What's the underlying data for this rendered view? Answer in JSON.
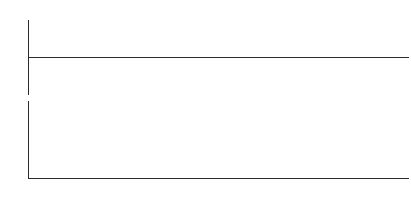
{
  "chart_data": [
    {
      "type": "bar",
      "panel": "top",
      "title": "",
      "xlabel": "",
      "ylabel": "",
      "ylim": [
        -50,
        50
      ],
      "yticks": [
        50,
        0,
        -50
      ],
      "ytick_labels": [
        "50%",
        "0%",
        "-50%"
      ],
      "grid": true,
      "legend": "none",
      "zero_line": true,
      "units": "percent",
      "categories": [
        "P1",
        "P2",
        "P3",
        "P4",
        "P5",
        "P6",
        "P7",
        "P8",
        "P9",
        "P10",
        "P11",
        "P12",
        "P13",
        "P14",
        "P15",
        "P16",
        "P17",
        "P18",
        "P19",
        "P20",
        "P21",
        "P22",
        "P23",
        "P24",
        "P25",
        "P26",
        "P27",
        "P28",
        "P29",
        "P30",
        "P31",
        "P32",
        "P33",
        "P34",
        "P35",
        "P36",
        "P37",
        "P38",
        "P39",
        "P40",
        "P41",
        "P42",
        "P43",
        "P44",
        "P45",
        "P46",
        "P47",
        "P48",
        "P49",
        "P50",
        "P51",
        "P52",
        "P53"
      ],
      "values": [
        30,
        31,
        28,
        26,
        29,
        28,
        27,
        20,
        26,
        24,
        23,
        29,
        29,
        30,
        -5,
        -6,
        22,
        26,
        27,
        26,
        21,
        24,
        26,
        15,
        26,
        29,
        28,
        30,
        34,
        36,
        29,
        32,
        31,
        30,
        25,
        28,
        28,
        26,
        24,
        27,
        26,
        27,
        26,
        27,
        27,
        26,
        32,
        24,
        23,
        22,
        22,
        21,
        23
      ]
    },
    {
      "type": "line",
      "panel": "bottom",
      "title": "",
      "xlabel": "",
      "ylabel": "",
      "ylim": [
        0,
        4000
      ],
      "yticks": [
        0,
        1000,
        2000,
        3000,
        4000
      ],
      "ytick_labels": [
        "0",
        "1000",
        "2000",
        "3000",
        "4000"
      ],
      "grid": true,
      "legend": "none",
      "markers": "circle",
      "categories": [
        "P1",
        "P2",
        "P3",
        "P4",
        "P5",
        "P6",
        "P7",
        "P8",
        "P9",
        "P10",
        "P11",
        "P12",
        "P13",
        "P14",
        "P15",
        "P16",
        "P17",
        "P18",
        "P19",
        "P20",
        "P21",
        "P22",
        "P23",
        "P24",
        "P25",
        "P26",
        "P27",
        "P28",
        "P29",
        "P30",
        "P31",
        "P32",
        "P33",
        "P34",
        "P35",
        "P36",
        "P37",
        "P38",
        "P39",
        "P40",
        "P41",
        "P42",
        "P43",
        "P44",
        "P45",
        "P46",
        "P47",
        "P48",
        "P49",
        "P50",
        "P51",
        "P52",
        "P53"
      ],
      "values": [
        1400,
        1150,
        1000,
        700,
        820,
        800,
        840,
        700,
        880,
        900,
        880,
        860,
        950,
        1000,
        980,
        1100,
        1500,
        1100,
        800,
        790,
        800,
        900,
        860,
        840,
        880,
        860,
        840,
        760,
        660,
        600,
        580,
        620,
        700,
        760,
        2050,
        1900,
        1750,
        1600,
        1500,
        1560,
        1560,
        1400,
        1300,
        1250,
        1200,
        1260,
        1500,
        1200,
        1000,
        950,
        980,
        1060,
        3200
      ],
      "xtick_labels": [
        "",
        "",
        "",
        "",
        "",
        "",
        "",
        "",
        "",
        "",
        "",
        "",
        "",
        "",
        "",
        "",
        "",
        "",
        "",
        "",
        "",
        "",
        "",
        "",
        "",
        "",
        "",
        "",
        "",
        "",
        "",
        "",
        "",
        "",
        "",
        "",
        "",
        "",
        "",
        "",
        "",
        "",
        "",
        "",
        "",
        "",
        "",
        "",
        "",
        "",
        "",
        "",
        ""
      ]
    }
  ],
  "annotations": {
    "highlight_band": {
      "name": "period-highlight",
      "label": "",
      "start_category": "P15",
      "end_category": "P16",
      "color": "#ebebeb"
    }
  },
  "colors": {
    "bar": "#2b2b2b",
    "line": "#8a8a8a",
    "marker_fill": "#ffffff",
    "marker_stroke": "#7a7a7a",
    "grid": "#d8d8d8",
    "axis": "#2b2b2b",
    "tick_text": "#6b6b6b",
    "xlabel_text": "#9a9a9a",
    "highlight": "#ebebeb"
  }
}
